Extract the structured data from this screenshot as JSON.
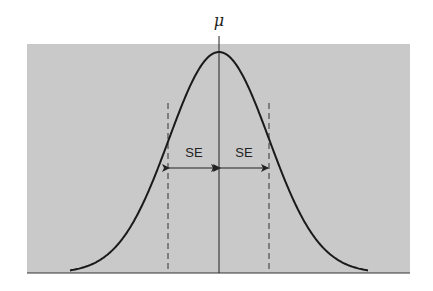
{
  "title_symbol": "μ",
  "labels": {
    "left_se": "SE",
    "right_se": "SE"
  },
  "colors": {
    "background": "#c9c9c9",
    "curve": "#1a1a1a",
    "lines": "#222222"
  },
  "geometry": {
    "box": {
      "x": 27,
      "y": 44,
      "w": 383,
      "h": 229
    },
    "mean_x": 219,
    "sigma_px": 50,
    "peak_y": 52,
    "baseline_y": 273,
    "curve_start_x": 70,
    "curve_end_x": 368
  }
}
